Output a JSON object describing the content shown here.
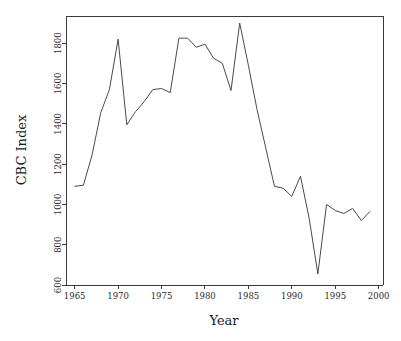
{
  "chart_data": {
    "type": "line",
    "title": "",
    "xlabel": "Year",
    "ylabel": "CBC Index",
    "xlim": [
      1964,
      2000.5
    ],
    "ylim": [
      600,
      1935
    ],
    "grid": false,
    "legend": null,
    "x_ticks": [
      1965,
      1970,
      1975,
      1980,
      1985,
      1990,
      1995,
      2000
    ],
    "x_tick_labels": [
      "1965",
      "1970",
      "1975",
      "1980",
      "1985",
      "1990",
      "1995",
      "2000"
    ],
    "y_ticks": [
      600,
      800,
      1000,
      1200,
      1400,
      1600,
      1800
    ],
    "y_tick_labels": [
      "600",
      "800",
      "1000",
      "1200",
      "1400",
      "1600",
      "1800"
    ],
    "series": [
      {
        "name": "CBC Index",
        "color": "#4a4a4a",
        "x": [
          1965,
          1966,
          1967,
          1968,
          1969,
          1970,
          1971,
          1972,
          1973,
          1974,
          1975,
          1976,
          1977,
          1978,
          1979,
          1980,
          1981,
          1982,
          1983,
          1984,
          1985,
          1986,
          1987,
          1988,
          1989,
          1990,
          1991,
          1992,
          1993,
          1994,
          1995,
          1996,
          1997,
          1998,
          1999
        ],
        "values": [
          1090,
          1095,
          1245,
          1455,
          1570,
          1820,
          1395,
          1460,
          1510,
          1570,
          1575,
          1555,
          1825,
          1825,
          1780,
          1795,
          1725,
          1700,
          1565,
          1900,
          1690,
          1470,
          1280,
          1090,
          1080,
          1040,
          1140,
          930,
          655,
          1000,
          970,
          955,
          980,
          920,
          965
        ]
      }
    ]
  },
  "axis_labels": {
    "x_title": "Year",
    "y_title": "CBC Index"
  },
  "plot_geometry": {
    "left": 66,
    "right": 383,
    "top": 16,
    "bottom": 285
  }
}
